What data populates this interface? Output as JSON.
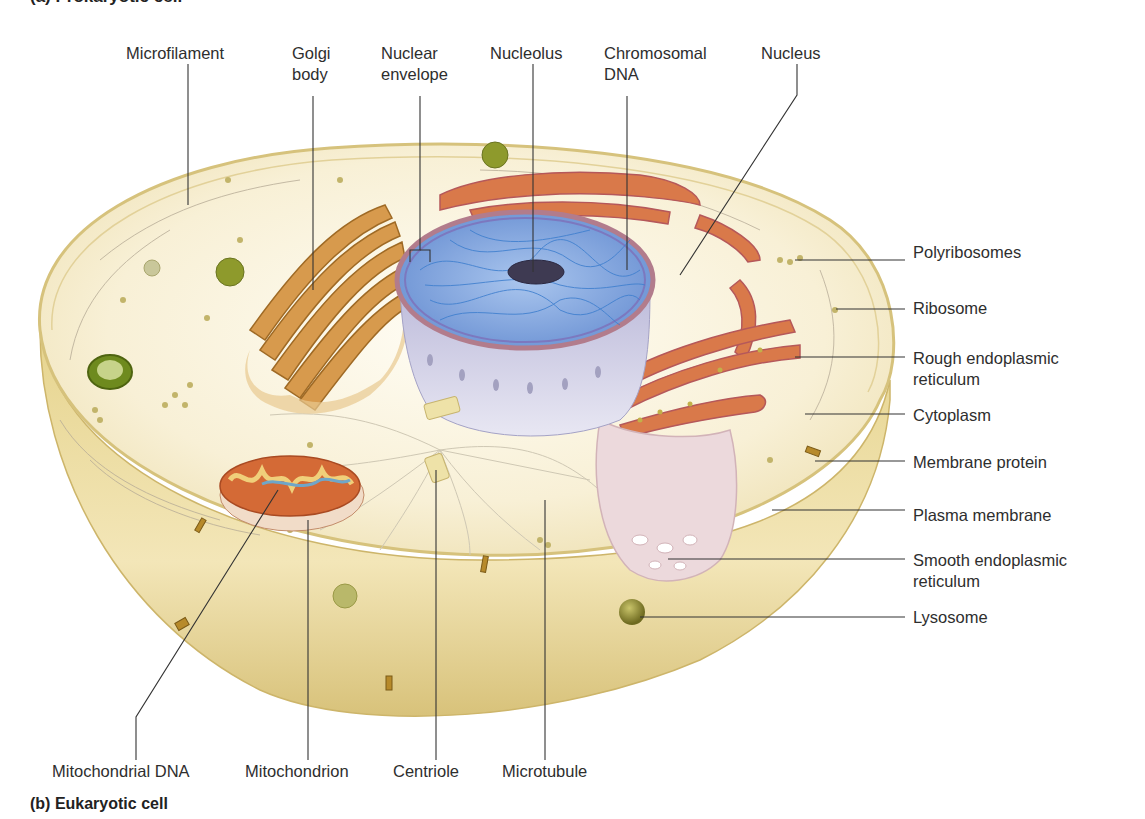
{
  "figure": {
    "top_title_partial": "(a) Prokaryotic cell",
    "caption": "(b) Eukaryotic cell"
  },
  "labels": {
    "top": [
      {
        "id": "microfilament",
        "text": "Microfilament"
      },
      {
        "id": "golgi",
        "line1": "Golgi",
        "line2": "body"
      },
      {
        "id": "nuclear-envelope",
        "line1": "Nuclear",
        "line2": "envelope"
      },
      {
        "id": "nucleolus",
        "text": "Nucleolus"
      },
      {
        "id": "chromosomal-dna",
        "line1": "Chromosomal",
        "line2": "DNA"
      },
      {
        "id": "nucleus",
        "text": "Nucleus"
      }
    ],
    "right": [
      {
        "id": "polyribosomes",
        "text": "Polyribosomes"
      },
      {
        "id": "ribosome",
        "text": "Ribosome"
      },
      {
        "id": "rough-er",
        "line1": "Rough endoplasmic",
        "line2": "reticulum"
      },
      {
        "id": "cytoplasm",
        "text": "Cytoplasm"
      },
      {
        "id": "membrane-protein",
        "text": "Membrane protein"
      },
      {
        "id": "plasma-membrane",
        "text": "Plasma membrane"
      },
      {
        "id": "smooth-er",
        "line1": "Smooth endoplasmic",
        "line2": "reticulum"
      },
      {
        "id": "lysosome",
        "text": "Lysosome"
      }
    ],
    "bottom": [
      {
        "id": "mitochondrial-dna",
        "text": "Mitochondrial DNA"
      },
      {
        "id": "mitochondrion",
        "text": "Mitochondrion"
      },
      {
        "id": "centriole",
        "text": "Centriole"
      },
      {
        "id": "microtubule",
        "text": "Microtubule"
      }
    ]
  },
  "colors": {
    "cytoplasm": "#f8f0d6",
    "membrane_outer": "#dcc77e",
    "nucleus_blue": "#5b8fd0",
    "nucleus_side": "#c9c6e0",
    "rough_er": "#d9794a",
    "golgi": "#c98a3a",
    "mitochondrion": "#d46a36",
    "lysosome": "#8a8a2e",
    "leader_line": "#333333"
  }
}
